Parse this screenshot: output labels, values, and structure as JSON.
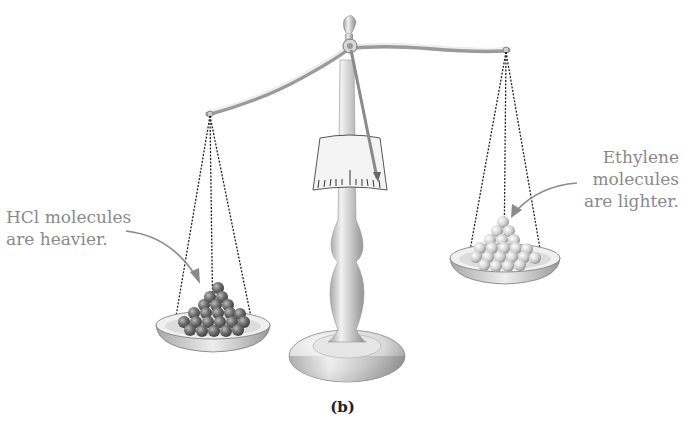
{
  "figure": {
    "caption": "(b)",
    "left_annotation": {
      "line1": "HCl molecules",
      "line2": "are heavier."
    },
    "right_annotation": {
      "line1": "Ethylene",
      "line2": "molecules",
      "line3": "are lighter."
    },
    "left_pan": {
      "contents": "HCl molecules",
      "ball_color": "#6f6f6f"
    },
    "right_pan": {
      "contents": "Ethylene molecules",
      "ball_color": "#c8c8c8"
    },
    "text_color": "#8a8a8a"
  }
}
